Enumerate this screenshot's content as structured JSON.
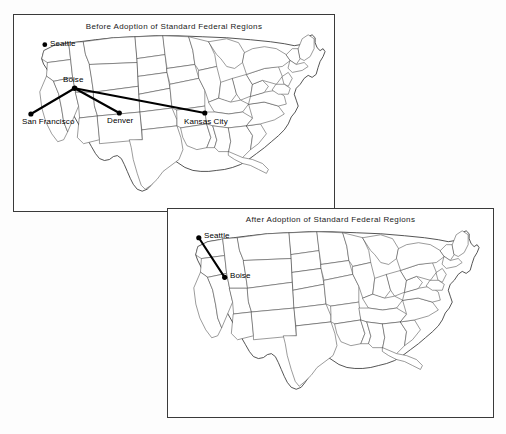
{
  "figure": {
    "background_color": "#fdfdfd",
    "line_color": "#4a4a4a",
    "route_color": "#000000"
  },
  "panels": [
    {
      "id": "before",
      "title": "Before Adoption of Standard Federal Regions",
      "hub": "Boise",
      "cities": [
        {
          "name": "Seattle",
          "x": 44,
          "y": 44,
          "label_dx": 5,
          "label_dy": -4
        },
        {
          "name": "Boise",
          "x": 74,
          "y": 88,
          "label_dx": -12,
          "label_dy": -14
        },
        {
          "name": "San Francisco",
          "x": 30,
          "y": 114,
          "label_dx": -9,
          "label_dy": 2
        },
        {
          "name": "Denver",
          "x": 119,
          "y": 113,
          "label_dx": -13,
          "label_dy": 2
        },
        {
          "name": "Kansas City",
          "x": 205,
          "y": 113,
          "label_dx": -22,
          "label_dy": 3
        }
      ],
      "routes": [
        {
          "from": "Boise",
          "to": "San Francisco"
        },
        {
          "from": "Boise",
          "to": "Denver"
        },
        {
          "from": "Boise",
          "to": "Kansas City"
        }
      ]
    },
    {
      "id": "after",
      "title": "After Adoption of Standard Federal Regions",
      "hub": "Seattle",
      "cities": [
        {
          "name": "Seattle",
          "x": 198,
          "y": 235,
          "label_dx": 5,
          "label_dy": -4
        },
        {
          "name": "Boise",
          "x": 224,
          "y": 275,
          "label_dx": 5,
          "label_dy": -4
        }
      ],
      "routes": [
        {
          "from": "Seattle",
          "to": "Boise"
        }
      ]
    }
  ]
}
